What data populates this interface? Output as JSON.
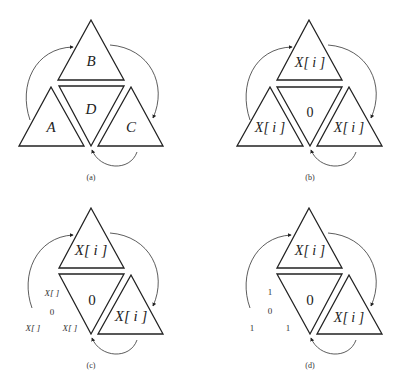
{
  "panels": [
    {
      "id": "a",
      "caption": "(a)",
      "top_triangle_label": "B",
      "center_triangle_label": "D",
      "left_triangle_label": "A",
      "right_triangle_label": "C"
    },
    {
      "id": "b",
      "caption": "(b)",
      "top_triangle_label": "X[ i ]",
      "center_triangle_label": "0",
      "left_triangle_label": "X[ i ]",
      "right_triangle_label": "X[ i ]"
    },
    {
      "id": "c",
      "caption": "(c)",
      "top_triangle_label": "X[ i ]",
      "center_triangle_label": "0",
      "right_triangle_label": "X[ i ]",
      "left_expanded": {
        "top": "X[ ]",
        "middle": "0",
        "bottom_left": "X[ ]",
        "bottom_right": "X[ ]"
      }
    },
    {
      "id": "d",
      "caption": "(d)",
      "top_triangle_label": "X[ i ]",
      "center_triangle_label": "0",
      "right_triangle_label": "X[ i ]",
      "left_expanded": {
        "top": "1",
        "middle": "0",
        "bottom_left": "1",
        "bottom_right": "1"
      }
    }
  ]
}
